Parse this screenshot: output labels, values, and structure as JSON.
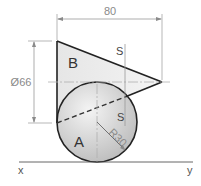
{
  "diagram": {
    "labels": {
      "region_b": "B",
      "region_a": "A",
      "section_top": "S",
      "section_bottom": "S",
      "axis_x": "x",
      "axis_y": "y"
    },
    "dimensions": {
      "width": "80",
      "diameter": "Ø66",
      "radius": "R30"
    },
    "colors": {
      "outline": "#222222",
      "dim_line": "#9a9a9a",
      "center_line": "#b0b0b0",
      "triangle_fill": "#eaeaea",
      "sphere_fill_light": "#f2f2f2",
      "sphere_fill_dark": "#bdbdbd",
      "text": "#333333"
    }
  }
}
